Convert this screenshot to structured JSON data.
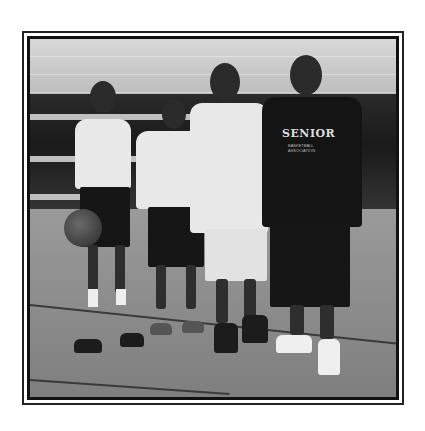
{
  "image": {
    "description": "Framed black-and-white photograph of four people standing on a gym basketball court",
    "frame": "double black border on white background",
    "subjects": [
      {
        "position": "far-left",
        "attire": "white t-shirt, black shorts, holding basketball"
      },
      {
        "position": "center-left",
        "attire": "white long-sleeve shirt, black shorts, thumbs up"
      },
      {
        "position": "center-right",
        "attire": "white t-shirt, white shorts, black sneakers"
      },
      {
        "position": "far-right",
        "attire": "black t-shirt, black shorts, white sneakers"
      }
    ],
    "shirt_text": {
      "main": "SENIOR",
      "sub": "BASKETBALL ASSOCIATION"
    },
    "setting": "indoor gymnasium with bleachers"
  }
}
